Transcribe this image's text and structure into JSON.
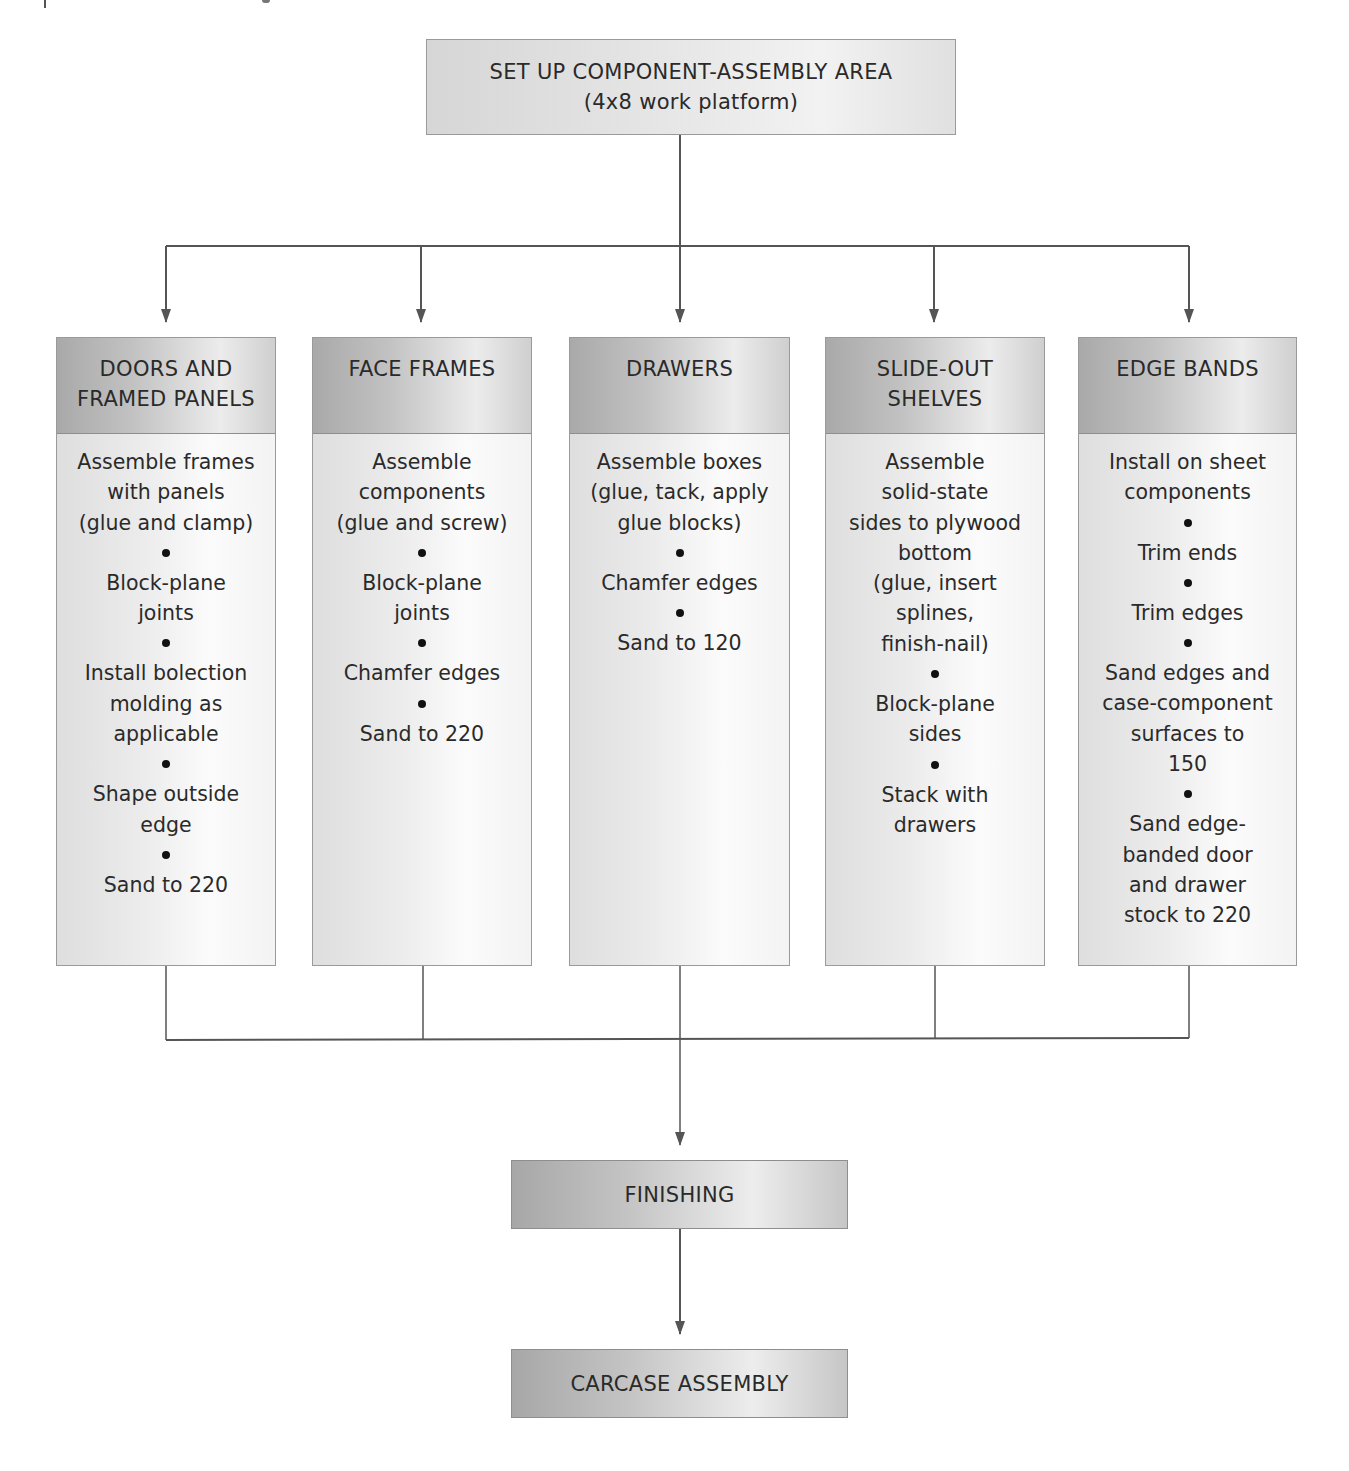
{
  "diagram": {
    "type": "flowchart",
    "start": {
      "title": "SET UP COMPONENT-ASSEMBLY AREA",
      "subtitle": "(4x8 work platform)"
    },
    "branches": [
      {
        "title_lines": [
          "DOORS AND",
          "FRAMED PANELS"
        ],
        "steps": [
          "Assemble frames\nwith panels\n(glue and clamp)",
          "Block-plane\njoints",
          "Install bolection\nmolding as\napplicable",
          "Shape outside\nedge",
          "Sand to 220"
        ]
      },
      {
        "title_lines": [
          "FACE FRAMES"
        ],
        "steps": [
          "Assemble\ncomponents\n(glue and screw)",
          "Block-plane\njoints",
          "Chamfer edges",
          "Sand to 220"
        ]
      },
      {
        "title_lines": [
          "DRAWERS"
        ],
        "steps": [
          "Assemble boxes\n(glue, tack, apply\nglue blocks)",
          "Chamfer edges",
          "Sand to 120"
        ]
      },
      {
        "title_lines": [
          "SLIDE-OUT",
          "SHELVES"
        ],
        "steps": [
          "Assemble\nsolid-state\nsides to plywood\nbottom\n(glue, insert\nsplines,\nfinish-nail)",
          "Block-plane\nsides",
          "Stack with\ndrawers"
        ]
      },
      {
        "title_lines": [
          "EDGE BANDS"
        ],
        "steps": [
          "Install on sheet\ncomponents",
          "Trim ends",
          "Trim edges",
          "Sand edges and\ncase-component\nsurfaces to\n150",
          "Sand edge-\nbanded door\nand drawer\nstock to 220"
        ]
      }
    ],
    "merge": {
      "title": "FINISHING"
    },
    "end": {
      "title": "CARCASE ASSEMBLY"
    },
    "colors": {
      "line": "#555555",
      "box_border": "#9a9a9a",
      "header_dark": "#a9a9a9",
      "header_light": "#ececec",
      "body_light": "#fbfbfb",
      "text": "#2a2a2a"
    }
  }
}
